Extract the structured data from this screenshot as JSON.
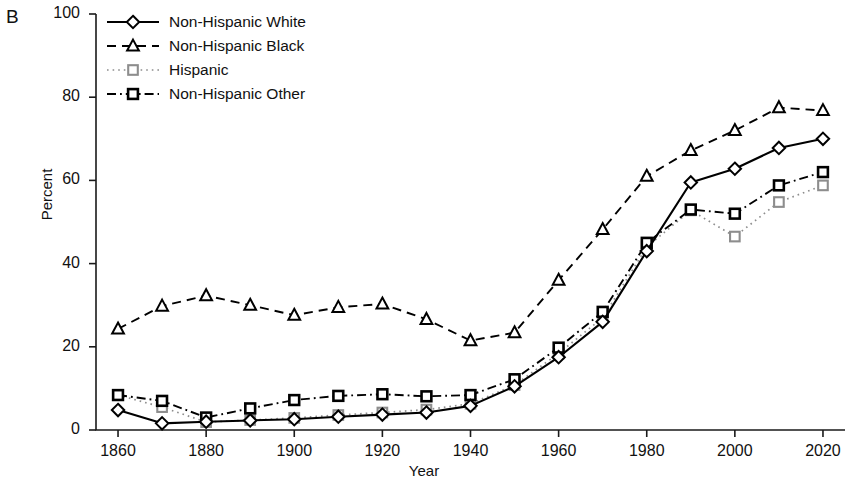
{
  "panel": {
    "label": "B"
  },
  "axes": {
    "ylabel": "Percent",
    "xlabel": "Year",
    "yticks": [
      "0",
      "20",
      "40",
      "60",
      "80",
      "100"
    ],
    "xticks": [
      "1860",
      "1880",
      "1900",
      "1920",
      "1940",
      "1960",
      "1980",
      "2000",
      "2020"
    ]
  },
  "legend": {
    "items": [
      {
        "label": "Non-Hispanic White",
        "style": "solid",
        "marker": "diamond",
        "color": "#000000"
      },
      {
        "label": "Non-Hispanic Black",
        "style": "dashed",
        "marker": "triangle",
        "color": "#000000"
      },
      {
        "label": "Hispanic",
        "style": "dotted",
        "marker": "square-gray",
        "color": "#8d8d8d"
      },
      {
        "label": "Non-Hispanic Other",
        "style": "dashdot",
        "marker": "square-bold",
        "color": "#000000"
      }
    ]
  },
  "chart_data": {
    "type": "line",
    "title": "",
    "xlabel": "Year",
    "ylabel": "Percent",
    "xlim": [
      1855,
      2025
    ],
    "ylim": [
      0,
      100
    ],
    "grid": false,
    "legend_position": "top-left",
    "x": [
      1860,
      1870,
      1880,
      1890,
      1900,
      1910,
      1920,
      1930,
      1940,
      1950,
      1960,
      1970,
      1980,
      1990,
      2000,
      2010,
      2020
    ],
    "series": [
      {
        "name": "Non-Hispanic White",
        "marker": "diamond",
        "linestyle": "solid",
        "color": "#000000",
        "values": [
          4.8,
          1.6,
          2.0,
          2.3,
          2.6,
          3.2,
          3.7,
          4.2,
          5.8,
          10.5,
          17.5,
          26.0,
          43.0,
          59.5,
          62.8,
          67.8,
          70.0
        ]
      },
      {
        "name": "Non-Hispanic Black",
        "marker": "triangle",
        "linestyle": "dashed",
        "color": "#000000",
        "values": [
          24.3,
          29.8,
          32.3,
          30.0,
          27.6,
          29.5,
          30.3,
          26.6,
          21.5,
          23.4,
          36.0,
          48.2,
          61.0,
          67.2,
          72.0,
          77.5,
          76.8
        ]
      },
      {
        "name": "Hispanic",
        "marker": "square-gray",
        "linestyle": "dotted",
        "color": "#8d8d8d",
        "values": [
          8.4,
          5.5,
          1.9,
          2.4,
          2.9,
          3.6,
          4.2,
          4.9,
          6.3,
          10.8,
          18.4,
          27.0,
          44.0,
          52.8,
          46.5,
          54.8,
          58.8
        ]
      },
      {
        "name": "Non-Hispanic Other",
        "marker": "square-bold",
        "linestyle": "dashdot",
        "color": "#000000",
        "values": [
          8.4,
          7.0,
          3.0,
          5.2,
          7.2,
          8.2,
          8.6,
          8.1,
          8.4,
          12.2,
          19.8,
          28.4,
          45.0,
          53.0,
          52.0,
          58.8,
          62.0
        ]
      }
    ]
  }
}
